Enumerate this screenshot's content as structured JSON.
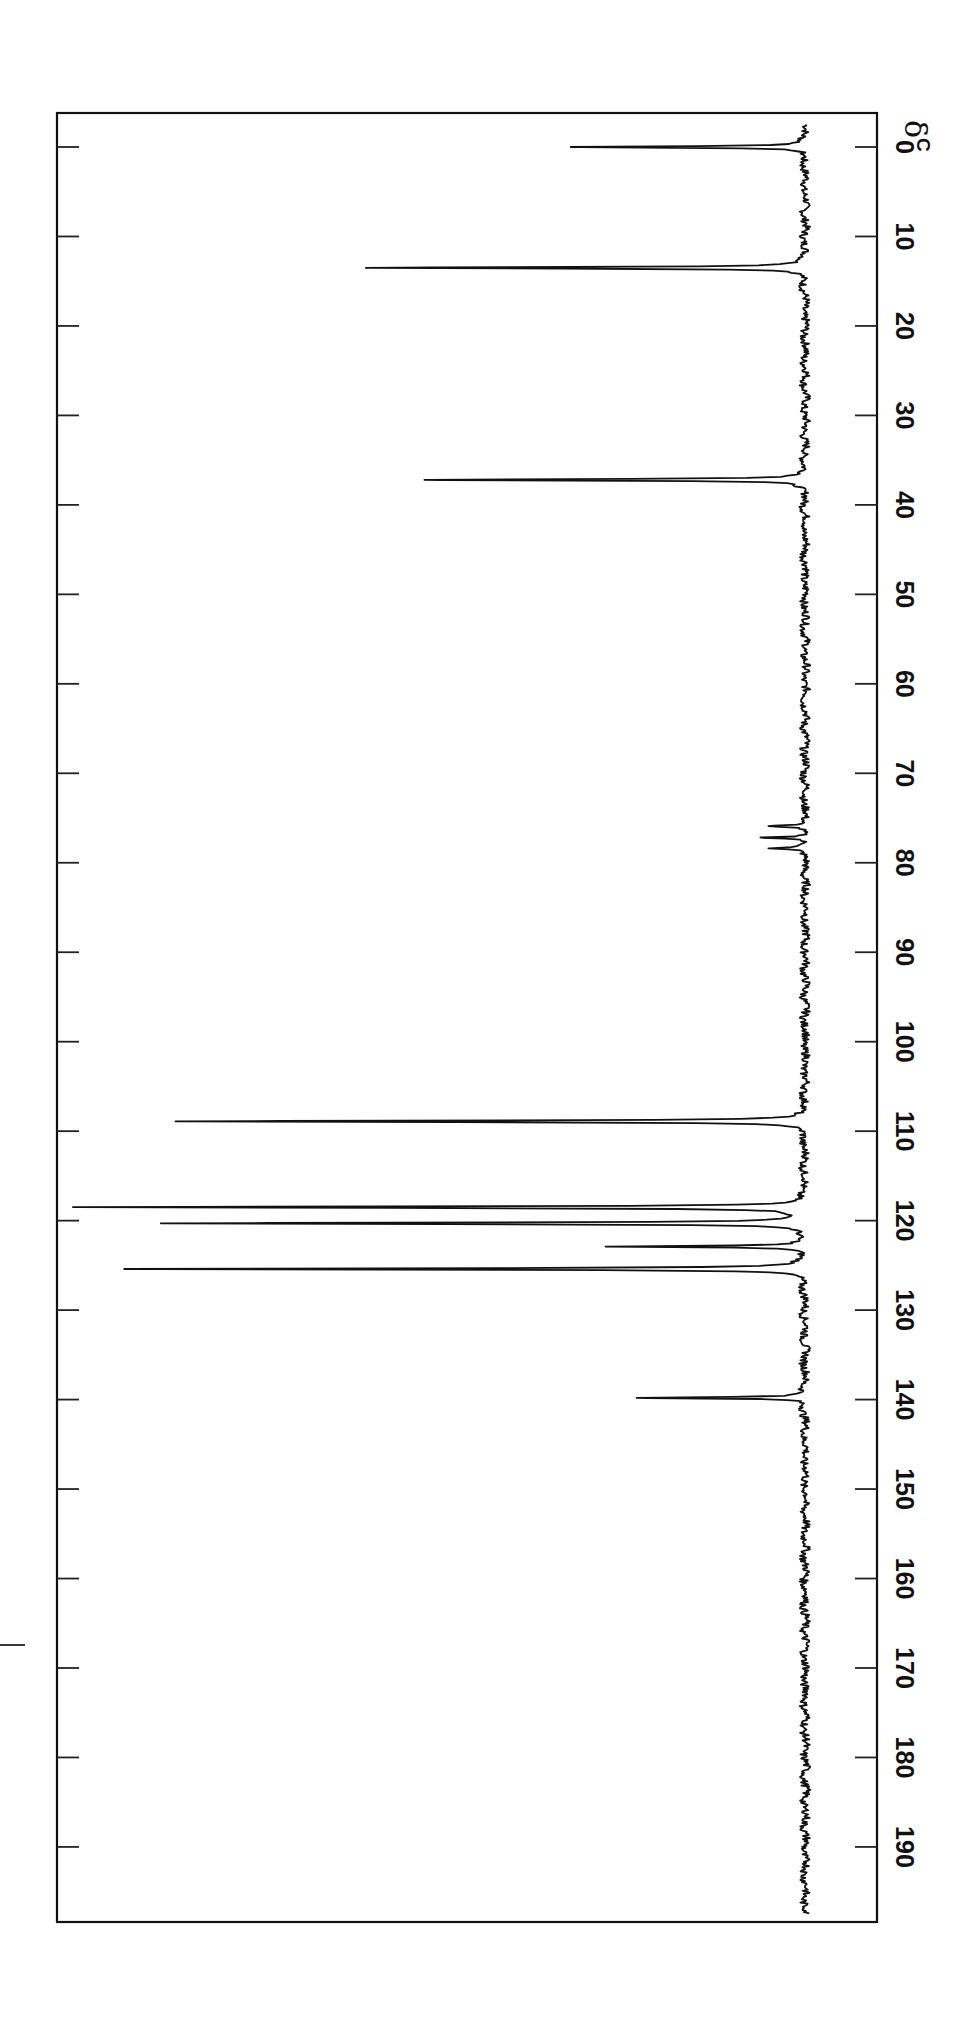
{
  "chart_data": {
    "type": "line",
    "title": "",
    "subtitle": "",
    "xlabel": "δC",
    "xlabel_main": "δ",
    "xlabel_sub": "C",
    "ylabel": "",
    "orientation": "rotated 90° clockwise; chemical shift axis runs top (0) to bottom (~198)",
    "xlim": [
      0,
      198
    ],
    "x_ticks": [
      0,
      10,
      20,
      30,
      40,
      50,
      60,
      70,
      80,
      90,
      100,
      110,
      120,
      130,
      140,
      150,
      160,
      170,
      180,
      190
    ],
    "x_tick_labels": [
      "0",
      "10",
      "20",
      "30",
      "40",
      "50",
      "60",
      "70",
      "80",
      "90",
      "100",
      "110",
      "120",
      "130",
      "140",
      "150",
      "160",
      "170",
      "180",
      "190"
    ],
    "grid": false,
    "legend": null,
    "peaks": [
      {
        "shift_ppm": 0.0,
        "relative_intensity": 0.32
      },
      {
        "shift_ppm": 13.5,
        "relative_intensity": 0.6
      },
      {
        "shift_ppm": 37.2,
        "relative_intensity": 0.52
      },
      {
        "shift_ppm": 75.9,
        "relative_intensity": 0.05
      },
      {
        "shift_ppm": 77.2,
        "relative_intensity": 0.06
      },
      {
        "shift_ppm": 78.4,
        "relative_intensity": 0.05
      },
      {
        "shift_ppm": 108.9,
        "relative_intensity": 0.86
      },
      {
        "shift_ppm": 118.5,
        "relative_intensity": 1.0
      },
      {
        "shift_ppm": 120.3,
        "relative_intensity": 0.88
      },
      {
        "shift_ppm": 122.9,
        "relative_intensity": 0.27
      },
      {
        "shift_ppm": 125.4,
        "relative_intensity": 0.93
      },
      {
        "shift_ppm": 139.8,
        "relative_intensity": 0.23
      }
    ],
    "annotations": [
      "solvent triplet near 77 ppm (CDCl3)"
    ]
  },
  "figure": {
    "axis_label_main": "δ",
    "axis_label_sub": "C"
  }
}
